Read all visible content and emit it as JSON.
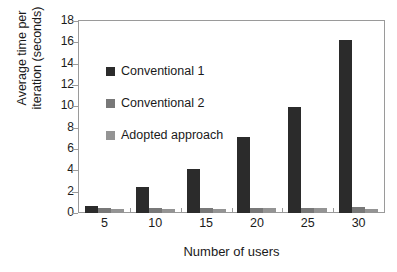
{
  "chart_data": {
    "type": "bar",
    "title": "",
    "xlabel": "Number of users",
    "ylabel": "Average time per iteration (seconds)",
    "ylabel_line1": "Average time per",
    "ylabel_line2": "iteration (seconds)",
    "categories": [
      "5",
      "10",
      "15",
      "20",
      "25",
      "30"
    ],
    "yticks": [
      0,
      2,
      4,
      6,
      8,
      10,
      12,
      14,
      16,
      18
    ],
    "ylim": [
      0,
      18
    ],
    "grid": false,
    "legend_position": "inside-upper-left",
    "series": [
      {
        "name": "Conventional 1",
        "color": "#2b2b2b",
        "values": [
          0.7,
          2.4,
          4.1,
          7.1,
          9.9,
          16.2
        ]
      },
      {
        "name": "Conventional 2",
        "color": "#787878",
        "values": [
          0.5,
          0.45,
          0.45,
          0.5,
          0.5,
          0.6
        ]
      },
      {
        "name": "Adopted approach",
        "color": "#949494",
        "values": [
          0.4,
          0.4,
          0.35,
          0.45,
          0.45,
          0.4
        ]
      }
    ]
  },
  "legend": {
    "items": [
      {
        "label": "Conventional 1",
        "color": "#2b2b2b"
      },
      {
        "label": "Conventional 2",
        "color": "#787878"
      },
      {
        "label": "Adopted approach",
        "color": "#949494"
      }
    ]
  }
}
